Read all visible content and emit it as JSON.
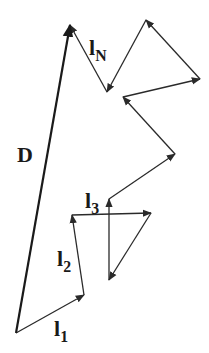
{
  "diagram": {
    "stroke_color": "#2a2a2a",
    "background": "#ffffff",
    "start_point": [
      16,
      333
    ],
    "path_points": [
      [
        16,
        333
      ],
      [
        84,
        295
      ],
      [
        72,
        215
      ],
      [
        151,
        213
      ],
      [
        109,
        280
      ],
      [
        109,
        199
      ],
      [
        175,
        154
      ],
      [
        123,
        97
      ],
      [
        200,
        79
      ],
      [
        146,
        20
      ],
      [
        107,
        92
      ],
      [
        70,
        25
      ]
    ],
    "end_to_end": {
      "from": [
        16,
        333
      ],
      "to": [
        70,
        25
      ]
    },
    "labels": {
      "D": {
        "text": "D"
      },
      "l1": {
        "base": "l",
        "sub": "1"
      },
      "l2": {
        "base": "l",
        "sub": "2"
      },
      "l3": {
        "base": "l",
        "sub": "3"
      },
      "lN": {
        "base": "l",
        "sub": "N"
      }
    }
  }
}
